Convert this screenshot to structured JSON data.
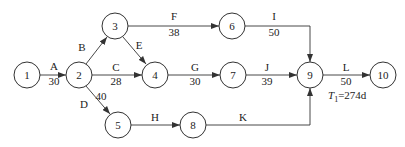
{
  "diagram": {
    "type": "activity-on-arrow network",
    "nodes": [
      {
        "id": "1",
        "label": "1",
        "x": 27,
        "y": 75
      },
      {
        "id": "2",
        "label": "2",
        "x": 79,
        "y": 75
      },
      {
        "id": "3",
        "label": "3",
        "x": 115,
        "y": 26
      },
      {
        "id": "4",
        "label": "4",
        "x": 155,
        "y": 75
      },
      {
        "id": "5",
        "label": "5",
        "x": 118,
        "y": 125
      },
      {
        "id": "6",
        "label": "6",
        "x": 232,
        "y": 26
      },
      {
        "id": "7",
        "label": "7",
        "x": 233,
        "y": 75
      },
      {
        "id": "8",
        "label": "8",
        "x": 193,
        "y": 125
      },
      {
        "id": "9",
        "label": "9",
        "x": 310,
        "y": 75
      },
      {
        "id": "10",
        "label": "10",
        "x": 383,
        "y": 75
      }
    ],
    "activities": [
      {
        "name": "A",
        "duration": "30",
        "from": "1",
        "to": "2"
      },
      {
        "name": "B",
        "duration": "",
        "from": "2",
        "to": "3"
      },
      {
        "name": "C",
        "duration": "28",
        "from": "2",
        "to": "4"
      },
      {
        "name": "D",
        "duration": "40",
        "from": "2",
        "to": "5"
      },
      {
        "name": "E",
        "duration": "",
        "from": "3",
        "to": "4"
      },
      {
        "name": "F",
        "duration": "38",
        "from": "3",
        "to": "6"
      },
      {
        "name": "G",
        "duration": "30",
        "from": "4",
        "to": "7"
      },
      {
        "name": "H",
        "duration": "",
        "from": "5",
        "to": "8"
      },
      {
        "name": "I",
        "duration": "50",
        "from": "6",
        "to": "9"
      },
      {
        "name": "J",
        "duration": "39",
        "from": "7",
        "to": "9"
      },
      {
        "name": "K",
        "duration": "",
        "from": "8",
        "to": "9"
      },
      {
        "name": "L",
        "duration": "50",
        "from": "9",
        "to": "10"
      }
    ],
    "annotation": {
      "symbol": "T",
      "subscript": "1",
      "value": "=274d"
    }
  }
}
